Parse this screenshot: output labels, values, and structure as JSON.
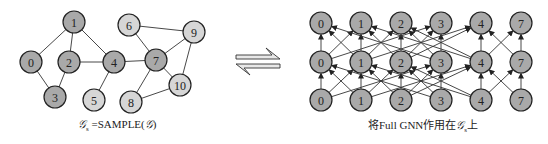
{
  "left_graph": {
    "nodes": [
      {
        "id": "0",
        "x": 31,
        "y": 62,
        "sampled": true
      },
      {
        "id": "1",
        "x": 74,
        "y": 22,
        "sampled": true
      },
      {
        "id": "2",
        "x": 69,
        "y": 62,
        "sampled": true
      },
      {
        "id": "3",
        "x": 55,
        "y": 97,
        "sampled": true
      },
      {
        "id": "4",
        "x": 114,
        "y": 62,
        "sampled": true
      },
      {
        "id": "5",
        "x": 94,
        "y": 100,
        "sampled": false
      },
      {
        "id": "6",
        "x": 129,
        "y": 25,
        "sampled": false
      },
      {
        "id": "7",
        "x": 156,
        "y": 60,
        "sampled": true
      },
      {
        "id": "8",
        "x": 131,
        "y": 102,
        "sampled": false
      },
      {
        "id": "9",
        "x": 194,
        "y": 32,
        "sampled": false
      },
      {
        "id": "10",
        "x": 180,
        "y": 85,
        "sampled": false
      }
    ],
    "edges": [
      [
        "0",
        "1"
      ],
      [
        "0",
        "3"
      ],
      [
        "1",
        "2"
      ],
      [
        "1",
        "4"
      ],
      [
        "2",
        "3"
      ],
      [
        "2",
        "4"
      ],
      [
        "4",
        "5"
      ],
      [
        "4",
        "7"
      ],
      [
        "6",
        "7"
      ],
      [
        "6",
        "9"
      ],
      [
        "7",
        "9"
      ],
      [
        "7",
        "10"
      ],
      [
        "7",
        "8"
      ],
      [
        "9",
        "10"
      ],
      [
        "8",
        "10"
      ]
    ],
    "caption_prefix": "𝒢",
    "caption_sub": "s",
    "caption_rest": " =SAMPLE(",
    "caption_g": "𝒢",
    "caption_end": ")"
  },
  "harpoon": {
    "label": "equilibrium-arrows"
  },
  "right_graph": {
    "columns": [
      "0",
      "1",
      "2",
      "3",
      "4",
      "7"
    ],
    "layers": 3,
    "edges": [
      [
        "0",
        "1"
      ],
      [
        "0",
        "3"
      ],
      [
        "1",
        "2"
      ],
      [
        "1",
        "4"
      ],
      [
        "2",
        "3"
      ],
      [
        "2",
        "4"
      ],
      [
        "4",
        "7"
      ]
    ],
    "caption_prefix": "将Full GNN作用在",
    "caption_g": "𝒢",
    "caption_sub": "s",
    "caption_suffix": "上"
  },
  "colors": {
    "sampled": "#a9a9a9",
    "unsampled": "#d6d6d6",
    "stroke": "#222222"
  }
}
